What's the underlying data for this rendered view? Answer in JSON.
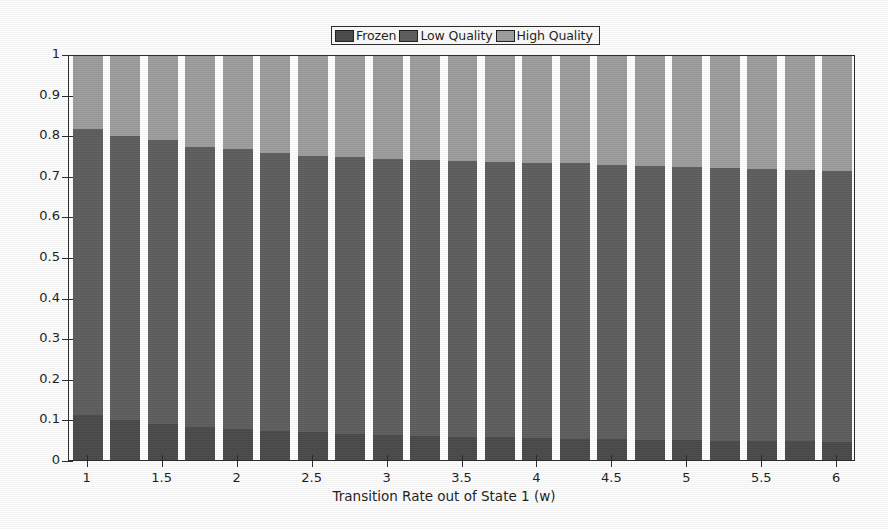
{
  "chart_data": {
    "type": "bar",
    "subtype": "stacked-bar",
    "title": "",
    "xlabel": "Transition Rate out of State 1 (w)",
    "ylabel": "",
    "xlim": [
      0.875,
      6.125
    ],
    "ylim": [
      0,
      1
    ],
    "grid": false,
    "legend_position": "top-center",
    "x": [
      1,
      1.25,
      1.5,
      1.75,
      2,
      2.25,
      2.5,
      2.75,
      3,
      3.25,
      3.5,
      3.75,
      4,
      4.25,
      4.5,
      4.75,
      5,
      5.25,
      5.5,
      5.75,
      6
    ],
    "xtick_labels": [
      "1",
      "1.5",
      "2",
      "2.5",
      "3",
      "3.5",
      "4",
      "4.5",
      "5",
      "5.5",
      "6"
    ],
    "xtick_values": [
      1,
      1.5,
      2,
      2.5,
      3,
      3.5,
      4,
      4.5,
      5,
      5.5,
      6
    ],
    "ytick_labels": [
      "0",
      "0.1",
      "0.2",
      "0.3",
      "0.4",
      "0.5",
      "0.6",
      "0.7",
      "0.8",
      "0.9",
      "1"
    ],
    "ytick_values": [
      0,
      0.1,
      0.2,
      0.3,
      0.4,
      0.5,
      0.6,
      0.7,
      0.8,
      0.9,
      1
    ],
    "series": [
      {
        "name": "Frozen",
        "color": "#4a4a4a",
        "values": [
          0.112,
          0.098,
          0.09,
          0.082,
          0.078,
          0.073,
          0.069,
          0.065,
          0.062,
          0.06,
          0.058,
          0.056,
          0.054,
          0.053,
          0.051,
          0.05,
          0.049,
          0.048,
          0.047,
          0.046,
          0.045
        ]
      },
      {
        "name": "Low Quality",
        "color": "#5e5e5e",
        "values": [
          0.708,
          0.705,
          0.701,
          0.694,
          0.691,
          0.688,
          0.683,
          0.684,
          0.684,
          0.683,
          0.683,
          0.681,
          0.681,
          0.681,
          0.679,
          0.677,
          0.676,
          0.674,
          0.673,
          0.671,
          0.67
        ]
      },
      {
        "name": "High Quality",
        "color": "#9d9d9d",
        "values": [
          0.18,
          0.197,
          0.209,
          0.224,
          0.231,
          0.239,
          0.248,
          0.251,
          0.254,
          0.257,
          0.259,
          0.263,
          0.265,
          0.266,
          0.27,
          0.273,
          0.275,
          0.278,
          0.28,
          0.283,
          0.285
        ]
      }
    ],
    "cumulative_tops": {
      "frozen_top": [
        0.112,
        0.098,
        0.09,
        0.082,
        0.078,
        0.073,
        0.069,
        0.065,
        0.062,
        0.06,
        0.058,
        0.056,
        0.054,
        0.053,
        0.051,
        0.05,
        0.049,
        0.048,
        0.047,
        0.046,
        0.045
      ],
      "low_quality_top": [
        0.82,
        0.803,
        0.791,
        0.776,
        0.769,
        0.761,
        0.752,
        0.749,
        0.746,
        0.743,
        0.741,
        0.737,
        0.735,
        0.734,
        0.73,
        0.727,
        0.725,
        0.722,
        0.72,
        0.717,
        0.715
      ],
      "high_quality_top": [
        1,
        1,
        1,
        1,
        1,
        1,
        1,
        1,
        1,
        1,
        1,
        1,
        1,
        1,
        1,
        1,
        1,
        1,
        1,
        1,
        1
      ]
    }
  },
  "legend": {
    "items": [
      {
        "label": "Frozen",
        "swatch": "#4a4a4a"
      },
      {
        "label": "Low Quality",
        "swatch": "#5e5e5e"
      },
      {
        "label": "High Quality",
        "swatch": "#9d9d9d"
      }
    ]
  },
  "axes": {
    "x_title": "Transition Rate out of State 1 (w)"
  },
  "colors": {
    "frozen": "#4a4a4a",
    "low_quality": "#5e5e5e",
    "high_quality": "#9d9d9d",
    "axis": "#2a2a2a",
    "background": "#fdfdfc",
    "plot_background": "#ffffff"
  }
}
